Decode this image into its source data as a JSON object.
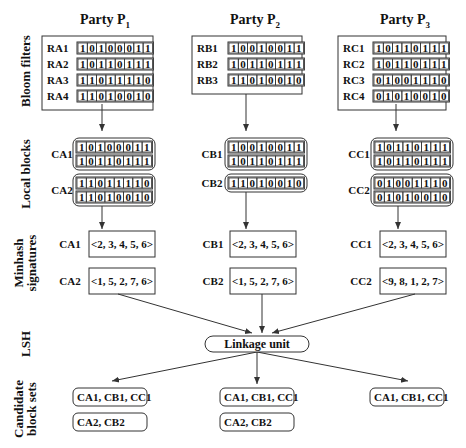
{
  "parties": [
    {
      "name": "Party P",
      "subscript": "1",
      "bloom_filters": [
        {
          "id": "RA1",
          "bits": "10100011"
        },
        {
          "id": "RA2",
          "bits": "10110111"
        },
        {
          "id": "RA3",
          "bits": "11011110"
        },
        {
          "id": "RA4",
          "bits": "11010010"
        }
      ],
      "local_blocks": [
        {
          "id": "CA1",
          "rows": [
            "10100011",
            "10110111"
          ]
        },
        {
          "id": "CA2",
          "rows": [
            "11011110",
            "11010010"
          ]
        }
      ],
      "minhash": [
        {
          "id": "CA1",
          "signature": "<2, 3, 4, 5, 6>"
        },
        {
          "id": "CA2",
          "signature": "<1, 5, 2, 7, 6>"
        }
      ],
      "candidate_sets": [
        "CA1, CB1, CC1",
        "CA2, CB2"
      ]
    },
    {
      "name": "Party P",
      "subscript": "2",
      "bloom_filters": [
        {
          "id": "RB1",
          "bits": "10010011"
        },
        {
          "id": "RB2",
          "bits": "10110111"
        },
        {
          "id": "RB3",
          "bits": "11010010"
        }
      ],
      "local_blocks": [
        {
          "id": "CB1",
          "rows": [
            "10010011",
            "10110111"
          ]
        },
        {
          "id": "CB2",
          "rows": [
            "11010010"
          ]
        }
      ],
      "minhash": [
        {
          "id": "CB1",
          "signature": "<2, 3, 4, 5, 6>"
        },
        {
          "id": "CB2",
          "signature": "<1, 5, 2, 7, 6>"
        }
      ],
      "candidate_sets": [
        "CA1, CB1, CC1",
        "CA2, CB2"
      ]
    },
    {
      "name": "Party P",
      "subscript": "3",
      "bloom_filters": [
        {
          "id": "RC1",
          "bits": "10110111"
        },
        {
          "id": "RC2",
          "bits": "10110111"
        },
        {
          "id": "RC3",
          "bits": "01001110"
        },
        {
          "id": "RC4",
          "bits": "01010010"
        }
      ],
      "local_blocks": [
        {
          "id": "CC1",
          "rows": [
            "10110111",
            "10110111"
          ]
        },
        {
          "id": "CC2",
          "rows": [
            "01001110",
            "01010010"
          ]
        }
      ],
      "minhash": [
        {
          "id": "CC1",
          "signature": "<2, 3, 4, 5, 6>"
        },
        {
          "id": "CC2",
          "signature": "<9, 8, 1, 2, 7>"
        }
      ],
      "candidate_sets": [
        "CA1, CB1, CC1"
      ]
    }
  ],
  "stages": {
    "bloom_filters": "Bloom filters",
    "local_blocks": "Local blocks",
    "minhash_line1": "Minhash",
    "minhash_line2": "signatures",
    "lsh": "LSH",
    "candidate_line1": "Candidate",
    "candidate_line2": "block sets"
  },
  "linkage_unit": "Linkage unit"
}
